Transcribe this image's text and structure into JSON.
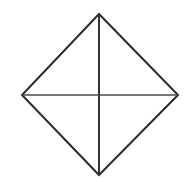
{
  "figure": {
    "background_color": "#ffffff",
    "canvas": {
      "width": 193,
      "height": 182
    },
    "shapes": {
      "outline": {
        "name": "rhombus-outline",
        "kind": "polygon",
        "stroke_color": "#2b2b2b",
        "stroke_width": 2,
        "fill": "none",
        "points": "99,14 178,95 99,175 22,95",
        "vertices": [
          {
            "label": "top",
            "x": 99,
            "y": 14
          },
          {
            "label": "right",
            "x": 178,
            "y": 95
          },
          {
            "label": "bottom",
            "x": 99,
            "y": 175
          },
          {
            "label": "left",
            "x": 22,
            "y": 95
          }
        ]
      },
      "vertical_diagonal": {
        "name": "vertical-diagonal",
        "kind": "line",
        "stroke_color": "#333333",
        "stroke_width": 2,
        "x1": 99,
        "y1": 14,
        "x2": 99,
        "y2": 175
      },
      "horizontal_diagonal": {
        "name": "horizontal-diagonal",
        "kind": "line",
        "stroke_color": "#4a4a4a",
        "stroke_width": 1.6,
        "x1": 22,
        "y1": 95,
        "x2": 178,
        "y2": 95
      },
      "center": {
        "name": "diagonal-intersection",
        "x": 99,
        "y": 95
      }
    },
    "labels": []
  }
}
